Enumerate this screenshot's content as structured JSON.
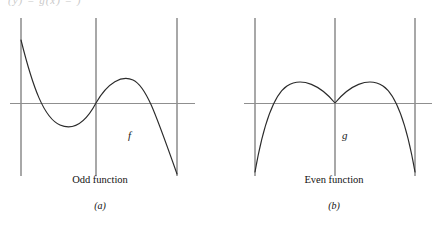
{
  "figure": {
    "clipped_header_text": "(y) = g(x) = )",
    "background_color": "#ffffff",
    "curve_color": "#2b2b2b",
    "axis_color": "#8f8f8f",
    "bound_color": "#a8a8a8",
    "width": 437,
    "height": 227
  },
  "panels": [
    {
      "id": "a",
      "function_label": "f",
      "caption_title": "Odd function",
      "caption_letter": "(a)",
      "symmetry": "origin",
      "label_x": 128,
      "label_y": 139
    },
    {
      "id": "b",
      "function_label": "g",
      "caption_title": "Even function",
      "caption_letter": "(b)",
      "symmetry": "y-axis",
      "label_x": 122,
      "label_y": 139
    }
  ],
  "chart_data": [
    {
      "type": "line",
      "title": "Odd function",
      "subtitle": "(a)",
      "series_name": "f",
      "xlabel": "",
      "ylabel": "",
      "grid": false,
      "legend": "none",
      "axes": {
        "x_axis_y_pixel": 103,
        "y_axis_x_pixel": 96,
        "left_bound_x_pixel": 21,
        "right_bound_x_pixel": 177,
        "top_bound_y_pixel": 18,
        "bottom_bound_y_pixel": 176
      },
      "path": "M 21,40 C 33,88 44,118 60,125 C 76,132 88,118 96,103 C 108,82 122,75 133,80 C 146,86 155,112 177,174",
      "points": [
        {
          "x": 21,
          "y": 40
        },
        {
          "x": 40,
          "y": 100
        },
        {
          "x": 60,
          "y": 125
        },
        {
          "x": 78,
          "y": 120
        },
        {
          "x": 96,
          "y": 103
        },
        {
          "x": 115,
          "y": 86
        },
        {
          "x": 133,
          "y": 80
        },
        {
          "x": 150,
          "y": 95
        },
        {
          "x": 165,
          "y": 130
        },
        {
          "x": 177,
          "y": 174
        }
      ],
      "annotations": [
        "f"
      ]
    },
    {
      "type": "line",
      "title": "Even function",
      "subtitle": "(b)",
      "series_name": "g",
      "xlabel": "",
      "ylabel": "",
      "grid": false,
      "legend": "none",
      "axes": {
        "x_axis_y_pixel": 103,
        "y_axis_x_pixel": 335,
        "left_bound_x_pixel": 255,
        "right_bound_x_pixel": 415,
        "top_bound_y_pixel": 18,
        "bottom_bound_y_pixel": 176
      },
      "path": "M 255,172 C 262,132 272,96 287,86 C 302,76 321,86 335,103 C 349,86 368,76 383,86 C 398,96 408,132 415,172",
      "points": [
        {
          "x": 255,
          "y": 172
        },
        {
          "x": 268,
          "y": 112
        },
        {
          "x": 287,
          "y": 86
        },
        {
          "x": 302,
          "y": 79
        },
        {
          "x": 318,
          "y": 88
        },
        {
          "x": 335,
          "y": 103
        },
        {
          "x": 352,
          "y": 88
        },
        {
          "x": 368,
          "y": 79
        },
        {
          "x": 383,
          "y": 86
        },
        {
          "x": 402,
          "y": 112
        },
        {
          "x": 415,
          "y": 172
        }
      ],
      "annotations": [
        "g"
      ]
    }
  ]
}
